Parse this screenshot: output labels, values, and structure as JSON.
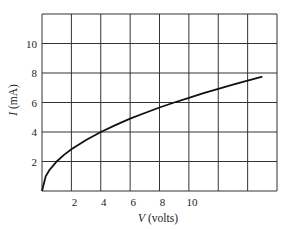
{
  "chart_data": {
    "type": "line",
    "title": "",
    "xlabel_var": "V",
    "xlabel_unit": " (volts)",
    "ylabel_var": "I",
    "ylabel_unit": " (mA)",
    "xlim": [
      0,
      16
    ],
    "ylim": [
      0,
      12
    ],
    "grid": true,
    "x_ticks": [
      {
        "value": 2,
        "label": "2"
      },
      {
        "value": 4,
        "label": "4"
      },
      {
        "value": 6,
        "label": "6"
      },
      {
        "value": 8,
        "label": "8"
      },
      {
        "value": 10,
        "label": "10"
      }
    ],
    "y_ticks": [
      {
        "value": 2,
        "label": "2"
      },
      {
        "value": 4,
        "label": "4"
      },
      {
        "value": 6,
        "label": "6"
      },
      {
        "value": 8,
        "label": "8"
      },
      {
        "value": 10,
        "label": "10"
      }
    ],
    "series": [
      {
        "name": "I vs V",
        "x": [
          0,
          0.25,
          0.5,
          1,
          1.5,
          2,
          3,
          4,
          5,
          6,
          7,
          8,
          9,
          10,
          11,
          12,
          13,
          14,
          15
        ],
        "y": [
          0,
          1.0,
          1.41,
          2.0,
          2.45,
          2.83,
          3.46,
          4.0,
          4.47,
          4.9,
          5.29,
          5.66,
          6.0,
          6.32,
          6.63,
          6.93,
          7.21,
          7.48,
          7.75
        ]
      }
    ]
  }
}
